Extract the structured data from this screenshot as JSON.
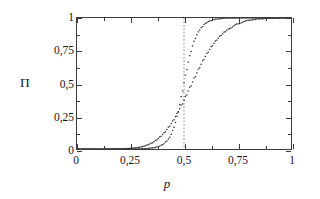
{
  "figure": {
    "background": "#ffffff",
    "frame_color": "#3b3b3b"
  },
  "axis": {
    "y_title": "Π",
    "x_title": "p"
  },
  "ticks": {
    "x_labels": [
      "0",
      "0,25",
      "0,5",
      "0,75",
      "1"
    ],
    "y_labels": [
      "0",
      "0,25",
      "0,5",
      "0,75",
      "1"
    ]
  },
  "chart_data": {
    "type": "scatter",
    "title": "",
    "subtitle": "",
    "xlabel": "p",
    "ylabel": "Π",
    "xlim": [
      0,
      1
    ],
    "ylim": [
      0,
      1
    ],
    "xticks": [
      0,
      0.25,
      0.5,
      0.75,
      1
    ],
    "yticks": [
      0,
      0.25,
      0.5,
      0.75,
      1
    ],
    "xticklabels": [
      "0",
      "0,25",
      "0,5",
      "0,75",
      "1"
    ],
    "yticklabels": [
      "0",
      "0,25",
      "0,5",
      "0,75",
      "1"
    ],
    "minor_ticks": true,
    "grid": false,
    "legend": null,
    "legend_position": "none",
    "marker": "dot",
    "marker_color": "#2b2b2b",
    "series": [
      {
        "name": "shallow-sigmoid",
        "comment": "broad transition, midpoint near p=0.55",
        "x": [
          0.0,
          0.05,
          0.1,
          0.15,
          0.2,
          0.24,
          0.27,
          0.29,
          0.31,
          0.33,
          0.35,
          0.37,
          0.39,
          0.41,
          0.43,
          0.45,
          0.47,
          0.49,
          0.51,
          0.53,
          0.55,
          0.57,
          0.59,
          0.61,
          0.63,
          0.65,
          0.67,
          0.69,
          0.71,
          0.75,
          0.8,
          0.85,
          0.9,
          0.95,
          1.0
        ],
        "y": [
          0.0,
          0.0,
          0.0,
          0.001,
          0.002,
          0.004,
          0.008,
          0.013,
          0.02,
          0.031,
          0.046,
          0.067,
          0.094,
          0.128,
          0.17,
          0.219,
          0.276,
          0.339,
          0.407,
          0.477,
          0.547,
          0.615,
          0.678,
          0.735,
          0.785,
          0.828,
          0.864,
          0.894,
          0.918,
          0.955,
          0.982,
          0.993,
          0.998,
          1.0,
          1.0
        ]
      },
      {
        "name": "steep-sigmoid",
        "comment": "sharp transition, midpoint near p=0.505",
        "x": [
          0.0,
          0.1,
          0.2,
          0.28,
          0.32,
          0.36,
          0.38,
          0.4,
          0.42,
          0.43,
          0.44,
          0.45,
          0.46,
          0.47,
          0.48,
          0.49,
          0.5,
          0.51,
          0.52,
          0.53,
          0.54,
          0.55,
          0.56,
          0.57,
          0.58,
          0.6,
          0.62,
          0.65,
          0.7,
          0.8,
          0.9,
          1.0
        ],
        "y": [
          0.0,
          0.0,
          0.0,
          0.001,
          0.003,
          0.01,
          0.018,
          0.033,
          0.06,
          0.082,
          0.112,
          0.152,
          0.203,
          0.266,
          0.34,
          0.421,
          0.505,
          0.587,
          0.663,
          0.73,
          0.787,
          0.834,
          0.872,
          0.902,
          0.926,
          0.959,
          0.978,
          0.992,
          0.999,
          1.0,
          1.0,
          1.0
        ]
      }
    ],
    "annotations": [
      {
        "type": "vertical-line",
        "name": "p-critical-line",
        "x": 0.5,
        "style": "dotted",
        "color": "#777777",
        "y_from": 0.0,
        "y_to": 1.0
      }
    ]
  }
}
